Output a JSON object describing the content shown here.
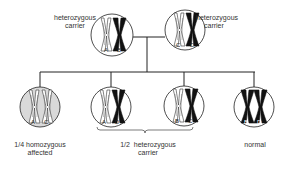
{
  "colors": {
    "line": "#222222",
    "affected_fill": "#d9d9d9",
    "normal_fill": "#ffffff",
    "mutant_chromosome": "#ffffff",
    "normal_chromosome": "#111111"
  },
  "parents": [
    {
      "id": "parent-1",
      "label_line1": "heterozygous",
      "label_line2": "carrier",
      "alleles": [
        {
          "letter": "A",
          "type": "outline"
        },
        {
          "letter": "B",
          "type": "solid"
        }
      ]
    },
    {
      "id": "parent-2",
      "label_line1": "heterozygous",
      "label_line2": "carrier",
      "alleles": [
        {
          "letter": "C",
          "type": "outline"
        },
        {
          "letter": "D",
          "type": "solid"
        }
      ]
    }
  ],
  "children": [
    {
      "id": "child-1",
      "status": "affected",
      "alleles": [
        {
          "letter": "A",
          "type": "outline"
        },
        {
          "letter": "C",
          "type": "outline"
        }
      ]
    },
    {
      "id": "child-2",
      "status": "carrier",
      "alleles": [
        {
          "letter": "A",
          "type": "outline"
        },
        {
          "letter": "D",
          "type": "solid"
        }
      ]
    },
    {
      "id": "child-3",
      "status": "carrier",
      "alleles": [
        {
          "letter": "B",
          "type": "outline"
        },
        {
          "letter": "C",
          "type": "solid"
        }
      ]
    },
    {
      "id": "child-4",
      "status": "normal",
      "alleles": [
        {
          "letter": "B",
          "type": "solid"
        },
        {
          "letter": "D",
          "type": "solid"
        }
      ]
    }
  ],
  "outcome_labels": {
    "affected_line1": "1/4 homozygous",
    "affected_line2": "affected",
    "carrier_line1": "1/2  heterozygous",
    "carrier_line2": "carrier",
    "normal": "normal"
  }
}
